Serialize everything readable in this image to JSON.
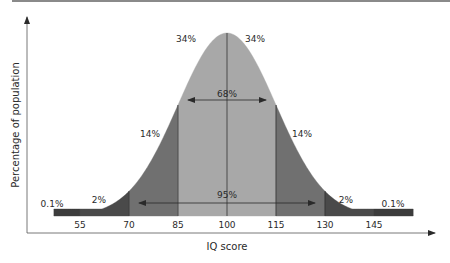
{
  "chart_data": {
    "type": "area",
    "title": "",
    "xlabel": "IQ score",
    "ylabel": "Percentage of population",
    "mean": 100,
    "sd": 15,
    "xlim": [
      47,
      157
    ],
    "x_ticks": [
      55,
      70,
      85,
      100,
      115,
      130,
      145
    ],
    "x_tick_labels": [
      "55",
      "70",
      "85",
      "100",
      "115",
      "130",
      "145"
    ],
    "regions": [
      {
        "name": "left-tail",
        "from": 47,
        "to": 55,
        "label": "0.1%",
        "color": "#3c3c3c"
      },
      {
        "name": "left-2sd",
        "from": 55,
        "to": 70,
        "label": "2%",
        "color": "#4a4a4a"
      },
      {
        "name": "left-1sd",
        "from": 70,
        "to": 85,
        "label": "14%",
        "color": "#707070"
      },
      {
        "name": "left-center",
        "from": 85,
        "to": 100,
        "label": "34%",
        "color": "#a8a8a8"
      },
      {
        "name": "right-center",
        "from": 100,
        "to": 115,
        "label": "34%",
        "color": "#a8a8a8"
      },
      {
        "name": "right-1sd",
        "from": 115,
        "to": 130,
        "label": "14%",
        "color": "#707070"
      },
      {
        "name": "right-2sd",
        "from": 130,
        "to": 145,
        "label": "2%",
        "color": "#4a4a4a"
      },
      {
        "name": "right-tail",
        "from": 145,
        "to": 157,
        "label": "0.1%",
        "color": "#3c3c3c"
      }
    ],
    "spans": [
      {
        "name": "68-percent",
        "from": 85,
        "to": 115,
        "label": "68%"
      },
      {
        "name": "95-percent",
        "from": 70,
        "to": 130,
        "label": "95%"
      }
    ],
    "grid": false,
    "legend": "none"
  }
}
